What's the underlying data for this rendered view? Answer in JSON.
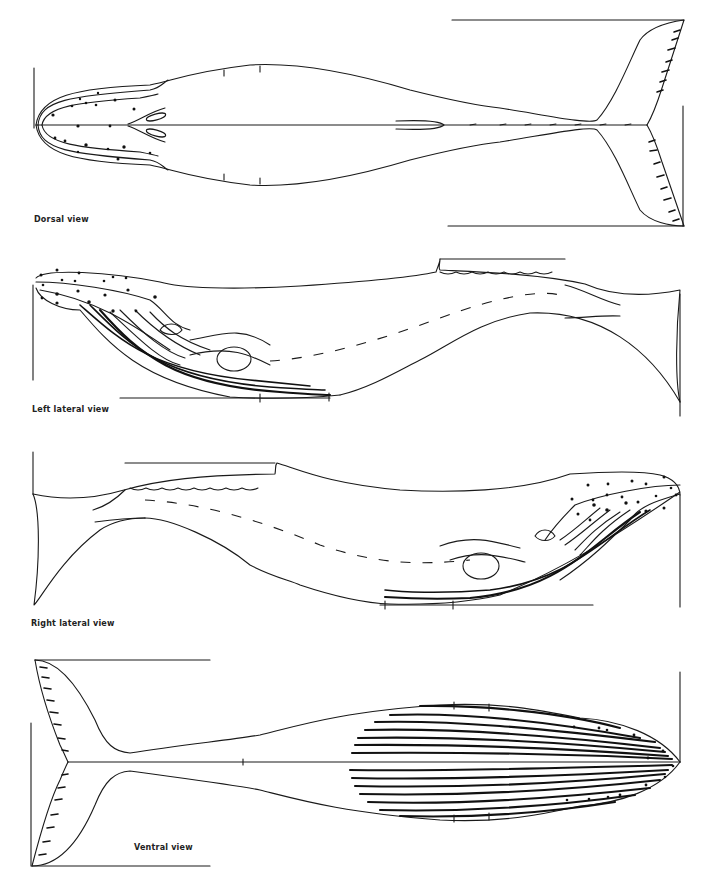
{
  "figure": {
    "views": [
      {
        "id": "dorsal",
        "label": "Dorsal view"
      },
      {
        "id": "left-lateral",
        "label": "Left lateral view"
      },
      {
        "id": "right-lateral",
        "label": "Right lateral view"
      },
      {
        "id": "ventral",
        "label": "Ventral view"
      }
    ],
    "line_color": "#1a1a1a",
    "background": "#ffffff"
  }
}
